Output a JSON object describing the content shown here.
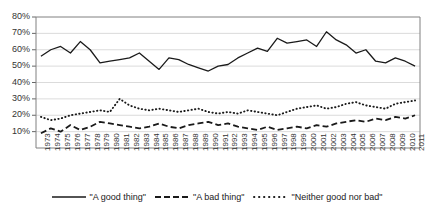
{
  "chart_data": {
    "type": "line",
    "title": "",
    "xlabel": "",
    "ylabel": "",
    "ylim": [
      0,
      80
    ],
    "ytick_labels": [
      "10%",
      "20%",
      "30%",
      "40%",
      "50%",
      "60%",
      "70%",
      "80%"
    ],
    "ytick_values": [
      10,
      20,
      30,
      40,
      50,
      60,
      70,
      80
    ],
    "grid": true,
    "legend_position": "bottom",
    "categories": [
      "1973",
      "1974",
      "1975",
      "1976",
      "1977",
      "1978",
      "1979",
      "1980",
      "1981",
      "1982",
      "1983",
      "1984",
      "1985",
      "1986",
      "1987",
      "1988",
      "1989",
      "1990",
      "1991",
      "1992",
      "1993",
      "1994",
      "1995",
      "1996",
      "1997",
      "1998",
      "1999",
      "2000",
      "2001",
      "2002",
      "2003",
      "2004",
      "2005",
      "2006",
      "2007",
      "2008",
      "2009",
      "2010",
      "2011"
    ],
    "series": [
      {
        "name": "\"A good thing\"",
        "style": "solid",
        "color": "#1a1a1a",
        "values": [
          56,
          60,
          62,
          58,
          65,
          60,
          52,
          53,
          54,
          55,
          58,
          53,
          48,
          55,
          54,
          51,
          49,
          47,
          50,
          51,
          55,
          58,
          61,
          59,
          67,
          64,
          65,
          66,
          62,
          71,
          66,
          63,
          58,
          60,
          53,
          52,
          55,
          53,
          50
        ]
      },
      {
        "name": "\"A bad thing\"",
        "style": "dashed",
        "color": "#1a1a1a",
        "values": [
          9,
          12,
          10,
          14,
          11,
          13,
          16,
          15,
          14,
          13,
          12,
          13,
          15,
          13,
          12,
          14,
          15,
          16,
          14,
          15,
          13,
          12,
          11,
          13,
          11,
          12,
          13,
          12,
          14,
          13,
          15,
          16,
          17,
          16,
          18,
          17,
          19,
          18,
          20
        ]
      },
      {
        "name": "\"Neither good nor bad\"",
        "style": "dotted",
        "color": "#1a1a1a",
        "values": [
          19,
          17,
          18,
          20,
          21,
          22,
          23,
          22,
          30,
          26,
          24,
          23,
          24,
          23,
          22,
          23,
          24,
          22,
          21,
          22,
          21,
          23,
          22,
          21,
          20,
          22,
          24,
          25,
          26,
          24,
          25,
          27,
          28,
          26,
          25,
          24,
          27,
          28,
          29
        ]
      }
    ]
  },
  "legend": {
    "items": [
      {
        "label": "\"A good thing\"",
        "style": "solid"
      },
      {
        "label": "\"A bad thing\"",
        "style": "dashed"
      },
      {
        "label": "\"Neither good nor bad\"",
        "style": "dotted"
      }
    ]
  }
}
